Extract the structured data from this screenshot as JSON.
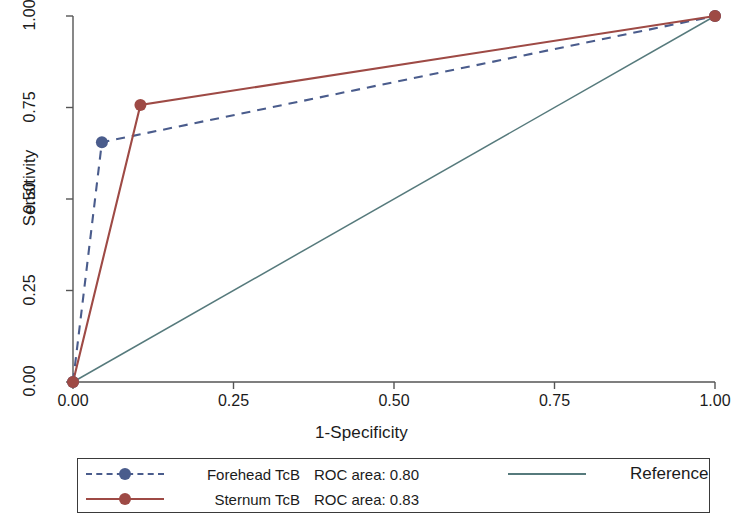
{
  "chart_data": {
    "type": "line",
    "title": "",
    "xlabel": "1-Specificity",
    "ylabel": "Sensitivity",
    "xlim": [
      0.0,
      1.0
    ],
    "ylim": [
      0.0,
      1.0
    ],
    "xticks": [
      "0.00",
      "0.25",
      "0.50",
      "0.75",
      "1.00"
    ],
    "yticks": [
      "0.00",
      "0.25",
      "0.50",
      "0.75",
      "1.00"
    ],
    "xtick_values": [
      0.0,
      0.25,
      0.5,
      0.75,
      1.0
    ],
    "ytick_values": [
      0.0,
      0.25,
      0.5,
      0.75,
      1.0
    ],
    "grid": false,
    "legend_position": "below-axes",
    "series": [
      {
        "name": "Forehead TcB",
        "auc_label": "ROC area: 0.80",
        "auc": 0.8,
        "color": "#4a5c8c",
        "style": "dashed",
        "marker": "circle",
        "x": [
          0.0,
          0.045,
          1.0
        ],
        "y": [
          0.0,
          0.655,
          1.0
        ],
        "marker_points": [
          [
            0.0,
            0.0
          ],
          [
            0.045,
            0.655
          ],
          [
            1.0,
            1.0
          ]
        ]
      },
      {
        "name": "Sternum TcB",
        "auc_label": "ROC area: 0.83",
        "auc": 0.83,
        "color": "#9e4a45",
        "style": "solid",
        "marker": "circle",
        "x": [
          0.0,
          0.105,
          1.0
        ],
        "y": [
          0.0,
          0.757,
          1.0
        ],
        "marker_points": [
          [
            0.0,
            0.0
          ],
          [
            0.105,
            0.757
          ],
          [
            1.0,
            1.0
          ]
        ]
      },
      {
        "name": "Reference",
        "auc_label": "",
        "color": "#567a7c",
        "style": "solid",
        "marker": "none",
        "x": [
          0.0,
          1.0
        ],
        "y": [
          0.0,
          1.0
        ],
        "marker_points": []
      }
    ]
  },
  "axes": {
    "x_label": "1-Specificity",
    "y_label": "Sensitivity",
    "x_ticks": [
      "0.00",
      "0.25",
      "0.50",
      "0.75",
      "1.00"
    ],
    "y_ticks": [
      "0.00",
      "0.25",
      "0.50",
      "0.75",
      "1.00"
    ],
    "axis_color": "#555555"
  },
  "legend": {
    "rows": [
      {
        "name": "Forehead TcB",
        "auc": "ROC area: 0.80",
        "color": "#4a5c8c",
        "style": "dashed"
      },
      {
        "name": "Sternum TcB",
        "auc": "ROC area: 0.83",
        "color": "#9e4a45",
        "style": "solid"
      }
    ],
    "reference_label": "Reference",
    "reference_color": "#567a7c"
  }
}
